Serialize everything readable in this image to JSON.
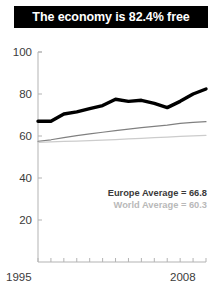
{
  "title": {
    "text": "The economy is 82.4% free"
  },
  "annotations": {
    "europe": "Europe Average = 66.8",
    "world": "World Average = 60.3"
  },
  "colors": {
    "banner_background": "#000000",
    "banner_text": "#ffffff",
    "country_line": "#000000",
    "europe_line": "#808080",
    "world_line": "#cccccc",
    "axis": "#b3b3b3",
    "tick_label": "#3b3b3b"
  },
  "axis": {
    "y_ticks": [
      "100",
      "80",
      "60",
      "40",
      "20"
    ],
    "x_ticks": [
      "1995",
      "2008"
    ]
  },
  "chart_data": {
    "type": "line",
    "title": "The economy is 82.4% free",
    "xlabel": "",
    "ylabel": "",
    "xlim": [
      1995,
      2008
    ],
    "ylim": [
      0,
      100
    ],
    "ytick_values": [
      20,
      40,
      60,
      80,
      100
    ],
    "xtick_values": [
      1995,
      1996,
      1997,
      1998,
      1999,
      2000,
      2001,
      2002,
      2003,
      2004,
      2005,
      2006,
      2007,
      2008
    ],
    "xtick_labels_shown": [
      1995,
      2008
    ],
    "grid": false,
    "legend": "none",
    "x": [
      1995,
      1996,
      1997,
      1998,
      1999,
      2000,
      2001,
      2002,
      2003,
      2004,
      2005,
      2006,
      2007,
      2008
    ],
    "series": [
      {
        "name": "Country",
        "color": "#000000",
        "width": 3.4,
        "values": [
          67.0,
          67.0,
          70.5,
          71.5,
          73.0,
          74.5,
          77.5,
          76.5,
          77.0,
          75.5,
          73.5,
          76.5,
          80.0,
          82.4
        ]
      },
      {
        "name": "Europe Average",
        "color": "#808080",
        "width": 1.2,
        "values": [
          57.5,
          58.2,
          59.2,
          60.2,
          61.0,
          61.8,
          62.6,
          63.3,
          64.0,
          64.6,
          65.2,
          66.0,
          66.5,
          66.8
        ]
      },
      {
        "name": "World Average",
        "color": "#cccccc",
        "width": 1.2,
        "values": [
          57.0,
          57.2,
          57.4,
          57.6,
          57.8,
          58.0,
          58.3,
          58.6,
          58.9,
          59.2,
          59.5,
          59.8,
          60.1,
          60.3
        ]
      }
    ],
    "annotations": [
      {
        "text": "Europe Average = 66.8",
        "color": "#3a3a3a"
      },
      {
        "text": "World Average = 60.3",
        "color": "#b9b9b9"
      }
    ]
  }
}
